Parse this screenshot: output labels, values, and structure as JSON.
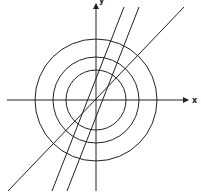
{
  "diagram": {
    "origin": {
      "x": 96,
      "y": 100
    },
    "axes": {
      "x_label": "x",
      "y_label": "y"
    },
    "circles": [
      {
        "name": "inner",
        "r": 30
      },
      {
        "name": "middle",
        "r": 43
      },
      {
        "name": "outer",
        "r": 61
      }
    ],
    "lines": [
      {
        "name": "line-steep",
        "x1": 52,
        "y1": 191,
        "x2": 124,
        "y2": 7
      },
      {
        "name": "line-medium",
        "x1": 67,
        "y1": 191,
        "x2": 139,
        "y2": 7
      },
      {
        "name": "line-shallow",
        "x1": 8,
        "y1": 191,
        "x2": 184,
        "y2": 7
      }
    ]
  }
}
